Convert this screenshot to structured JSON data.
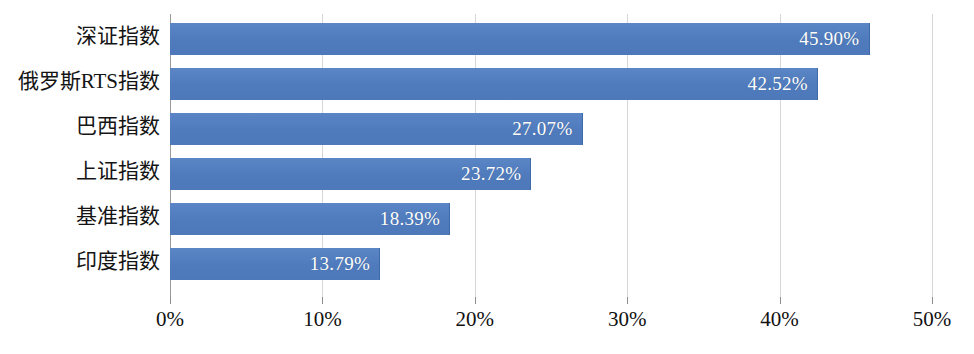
{
  "chart_data": {
    "type": "bar",
    "orientation": "horizontal",
    "title": "",
    "subtitle": "",
    "xlabel": "",
    "ylabel": "",
    "categories": [
      "深证指数",
      "俄罗斯RTS指数",
      "巴西指数",
      "上证指数",
      "基准指数",
      "印度指数"
    ],
    "values": [
      45.9,
      42.52,
      27.07,
      23.72,
      18.39,
      13.79
    ],
    "value_labels": [
      "45.90%",
      "42.52%",
      "27.07%",
      "23.72%",
      "18.39%",
      "13.79%"
    ],
    "xlim": [
      0,
      50
    ],
    "xticks": [
      0,
      10,
      20,
      30,
      40,
      50
    ],
    "xtick_labels": [
      "0%",
      "10%",
      "20%",
      "30%",
      "40%",
      "50%"
    ],
    "grid": true,
    "grid_axis": "x",
    "legend": false,
    "legend_position": "none",
    "bar_color": "#5280c2",
    "value_label_color": "#ffffff",
    "gridline_color": "#d6d6d6",
    "axis_color": "#9a9a9a",
    "background_color": "#ffffff",
    "series": [
      {
        "name": "涨跌幅",
        "values": [
          45.9,
          42.52,
          27.07,
          23.72,
          18.39,
          13.79
        ]
      }
    ],
    "bars": [
      {
        "category": "深证指数",
        "value": 45.9,
        "label": "45.90%"
      },
      {
        "category": "俄罗斯RTS指数",
        "value": 42.52,
        "label": "42.52%"
      },
      {
        "category": "巴西指数",
        "value": 27.07,
        "label": "27.07%"
      },
      {
        "category": "上证指数",
        "value": 23.72,
        "label": "23.72%"
      },
      {
        "category": "基准指数",
        "value": 18.39,
        "label": "18.39%"
      },
      {
        "category": "印度指数",
        "value": 13.79,
        "label": "13.79%"
      }
    ]
  }
}
